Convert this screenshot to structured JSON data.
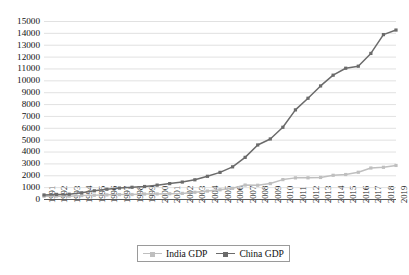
{
  "chart_data": {
    "type": "line",
    "title": "",
    "subtitle": "",
    "xlabel": "",
    "ylabel": "",
    "grid": true,
    "legend_position": "bottom-center",
    "ylim": [
      0,
      15000
    ],
    "ytick_step": 1000,
    "yticks": [
      "0",
      "1000",
      "2000",
      "3000",
      "4000",
      "5000",
      "6000",
      "7000",
      "8000",
      "9000",
      "10000",
      "11000",
      "12000",
      "13000",
      "14000",
      "15000"
    ],
    "categories": [
      "1991",
      "1992",
      "1993",
      "1994",
      "1995",
      "1996",
      "1997",
      "1998",
      "1999",
      "2000",
      "2001",
      "2002",
      "2003",
      "2004",
      "2005",
      "2006",
      "2007",
      "2008",
      "2009",
      "2010",
      "2011",
      "2012",
      "2013",
      "2014",
      "2015",
      "2016",
      "2017",
      "2018",
      "2019"
    ],
    "series": [
      {
        "name": "India GDP",
        "color": "#bfbfbf",
        "marker": "square",
        "values": [
          275,
          290,
          280,
          330,
          360,
          390,
          415,
          420,
          460,
          468,
          485,
          515,
          608,
          710,
          820,
          940,
          1217,
          1199,
          1342,
          1676,
          1823,
          1828,
          1857,
          2039,
          2104,
          2295,
          2653,
          2713,
          2870
        ]
      },
      {
        "name": "China GDP",
        "color": "#6b6b6b",
        "marker": "square",
        "values": [
          383,
          427,
          445,
          564,
          734,
          863,
          962,
          1029,
          1094,
          1211,
          1339,
          1470,
          1660,
          1955,
          2286,
          2752,
          3550,
          4594,
          5102,
          6087,
          7552,
          8532,
          9570,
          10476,
          11062,
          11233,
          12310,
          13895,
          14280
        ]
      }
    ]
  },
  "legend": {
    "items": [
      {
        "label": "India GDP"
      },
      {
        "label": "China GDP"
      }
    ]
  }
}
